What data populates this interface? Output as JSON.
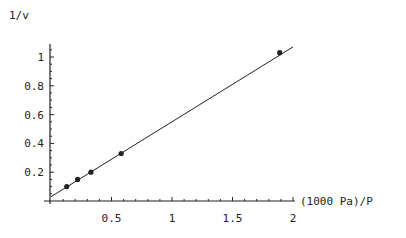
{
  "chart_data": {
    "type": "scatter",
    "title": "",
    "xlabel": "(1000 Pa)/P",
    "ylabel": "1/v",
    "xlim": [
      0,
      2
    ],
    "ylim": [
      0,
      1.05
    ],
    "x_ticks": [
      "0.5",
      "1",
      "1.5",
      "2"
    ],
    "y_ticks": [
      "0.2",
      "0.4",
      "0.6",
      "0.8",
      "1"
    ],
    "grid": false,
    "legend": null,
    "series": [
      {
        "name": "data",
        "type": "scatter",
        "x": [
          0.13,
          0.22,
          0.33,
          0.58,
          1.89
        ],
        "y": [
          0.1,
          0.15,
          0.2,
          0.33,
          1.03
        ]
      },
      {
        "name": "linear fit",
        "type": "line",
        "x": [
          0.0,
          2.0
        ],
        "y": [
          0.03,
          1.07
        ]
      }
    ]
  },
  "colors": {
    "ink": "#222222",
    "background": "#ffffff"
  }
}
